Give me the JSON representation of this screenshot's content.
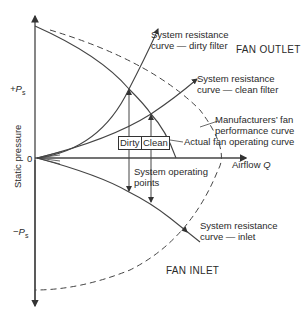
{
  "diagram": {
    "axes": {
      "y_label": "Static pressure",
      "y_pos_tick": "+P",
      "y_pos_tick_sub": "s",
      "y_zero_tick": "0",
      "y_neg_tick": "−P",
      "y_neg_tick_sub": "s",
      "x_label": "Airflow",
      "x_label_var": "Q"
    },
    "regions": {
      "outlet": "FAN OUTLET",
      "inlet": "FAN INLET"
    },
    "curves": {
      "dirty_line1": "System resistance",
      "dirty_line2": "curve — dirty filter",
      "clean_line1": "System resistance",
      "clean_line2": "curve — clean filter",
      "mfr_line1": "Manufacturers’ fan",
      "mfr_line2": "performance curve",
      "actual": "Actual fan operating curve",
      "inlet_line1": "System resistance",
      "inlet_line2": "curve — inlet"
    },
    "boxes": {
      "dirty": "Dirty",
      "clean": "Clean"
    },
    "operating_points_line1": "System operating",
    "operating_points_line2": "points",
    "colors": {
      "line": "#3a3a3a",
      "text": "#2a2a2a",
      "background": "#ffffff"
    }
  }
}
